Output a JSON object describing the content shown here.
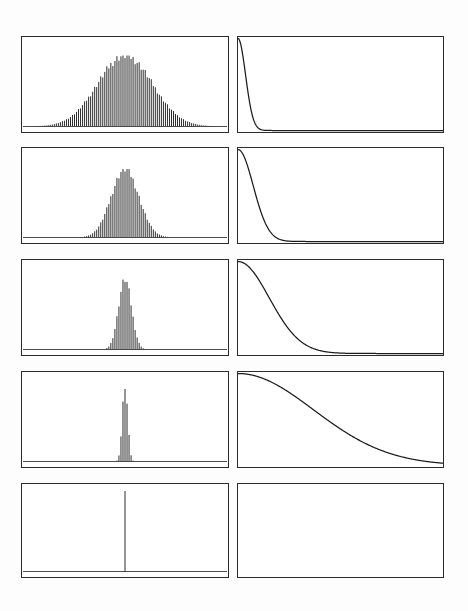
{
  "figure": {
    "background_color": "#ffffff",
    "ink_color": "#1c1c1c",
    "frame_color": "#2b2b2b",
    "rows": 5,
    "columns": 2,
    "column_roles": [
      "histogram",
      "decay-curve"
    ]
  },
  "layout": {
    "width": 468,
    "height": 611,
    "row_tops": [
      36,
      147,
      259,
      371,
      483
    ],
    "row_height": 97,
    "left_panel_x": 21,
    "left_panel_width": 208,
    "right_panel_x": 237,
    "right_panel_width": 207
  },
  "chart_data": [
    {
      "type": "bar",
      "panel_id": "hist-row-1",
      "title": "",
      "xlabel": "",
      "ylabel": "",
      "grid": false,
      "legend": null,
      "center": 0.5,
      "sigma": 0.135,
      "peak_height": 0.83,
      "bar_count": 101,
      "xlim": [
        0,
        1
      ],
      "ylim": [
        0,
        1
      ],
      "categories": [
        "0.00",
        "0.01",
        "0.02",
        "0.03",
        "0.04",
        "0.05",
        "0.06",
        "0.07",
        "0.08",
        "0.09",
        "0.10",
        "0.11",
        "0.12",
        "0.13",
        "0.14",
        "0.15",
        "0.16",
        "0.17",
        "0.18",
        "0.19",
        "0.20",
        "0.21",
        "0.22",
        "0.23",
        "0.24",
        "0.25",
        "0.26",
        "0.27",
        "0.28",
        "0.29",
        "0.30",
        "0.31",
        "0.32",
        "0.33",
        "0.34",
        "0.35",
        "0.36",
        "0.37",
        "0.38",
        "0.39",
        "0.40",
        "0.41",
        "0.42",
        "0.43",
        "0.44",
        "0.45",
        "0.46",
        "0.47",
        "0.48",
        "0.49",
        "0.50",
        "0.51",
        "0.52",
        "0.53",
        "0.54",
        "0.55",
        "0.56",
        "0.57",
        "0.58",
        "0.59",
        "0.60",
        "0.61",
        "0.62",
        "0.63",
        "0.64",
        "0.65",
        "0.66",
        "0.67",
        "0.68",
        "0.69",
        "0.70",
        "0.71",
        "0.72",
        "0.73",
        "0.74",
        "0.75",
        "0.76",
        "0.77",
        "0.78",
        "0.79",
        "0.80",
        "0.81",
        "0.82",
        "0.83",
        "0.84",
        "0.85",
        "0.86",
        "0.87",
        "0.88",
        "0.89",
        "0.90",
        "0.91",
        "0.92",
        "0.93",
        "0.94",
        "0.95",
        "0.96",
        "0.97",
        "0.98",
        "0.99",
        "1.00"
      ]
    },
    {
      "type": "line",
      "panel_id": "decay-row-1",
      "title": "",
      "xlabel": "",
      "ylabel": "",
      "grid": false,
      "legend": null,
      "decay_scale": 0.052,
      "shape_exponent": 2.0,
      "start_value": 1.0,
      "end_value": 0.0,
      "xlim": [
        0,
        1
      ],
      "ylim": [
        0,
        1
      ]
    },
    {
      "type": "bar",
      "panel_id": "hist-row-2",
      "title": "",
      "xlabel": "",
      "ylabel": "",
      "grid": false,
      "legend": null,
      "center": 0.5,
      "sigma": 0.068,
      "peak_height": 0.8,
      "bar_count": 101,
      "xlim": [
        0,
        1
      ],
      "ylim": [
        0,
        1
      ],
      "categories": []
    },
    {
      "type": "line",
      "panel_id": "decay-row-2",
      "title": "",
      "xlabel": "",
      "ylabel": "",
      "grid": false,
      "legend": null,
      "decay_scale": 0.105,
      "shape_exponent": 2.0,
      "start_value": 1.0,
      "end_value": 0.0,
      "xlim": [
        0,
        1
      ],
      "ylim": [
        0,
        1
      ]
    },
    {
      "type": "bar",
      "panel_id": "hist-row-3",
      "title": "",
      "xlabel": "",
      "ylabel": "",
      "grid": false,
      "legend": null,
      "center": 0.5,
      "sigma": 0.032,
      "peak_height": 0.82,
      "bar_count": 101,
      "xlim": [
        0,
        1
      ],
      "ylim": [
        0,
        1
      ],
      "categories": []
    },
    {
      "type": "line",
      "panel_id": "decay-row-3",
      "title": "",
      "xlabel": "",
      "ylabel": "",
      "grid": false,
      "legend": null,
      "decay_scale": 0.215,
      "shape_exponent": 2.0,
      "start_value": 1.0,
      "end_value": 0.0,
      "xlim": [
        0,
        1
      ],
      "ylim": [
        0,
        1
      ]
    },
    {
      "type": "bar",
      "panel_id": "hist-row-4",
      "title": "",
      "xlabel": "",
      "ylabel": "",
      "grid": false,
      "legend": null,
      "center": 0.5,
      "sigma": 0.0135,
      "peak_height": 0.88,
      "bar_count": 101,
      "xlim": [
        0,
        1
      ],
      "ylim": [
        0,
        1
      ],
      "categories": []
    },
    {
      "type": "line",
      "panel_id": "decay-row-4",
      "title": "",
      "xlabel": "",
      "ylabel": "",
      "grid": false,
      "legend": null,
      "decay_scale": 0.52,
      "shape_exponent": 2.0,
      "start_value": 1.0,
      "end_value": 0.02,
      "xlim": [
        0,
        1
      ],
      "ylim": [
        0,
        1
      ]
    },
    {
      "type": "bar",
      "panel_id": "hist-row-5",
      "title": "",
      "xlabel": "",
      "ylabel": "",
      "grid": false,
      "legend": null,
      "center": 0.5,
      "sigma": 0.0015,
      "peak_height": 1.0,
      "bar_count": 101,
      "xlim": [
        0,
        1
      ],
      "ylim": [
        0,
        1
      ],
      "categories": []
    },
    {
      "type": "line",
      "panel_id": "decay-row-5",
      "title": "",
      "xlabel": "",
      "ylabel": "",
      "grid": false,
      "legend": null,
      "decay_scale": 100.0,
      "shape_exponent": 2.0,
      "start_value": 1.0,
      "end_value": 1.0,
      "xlim": [
        0,
        1
      ],
      "ylim": [
        0,
        1
      ],
      "visible": false
    }
  ]
}
